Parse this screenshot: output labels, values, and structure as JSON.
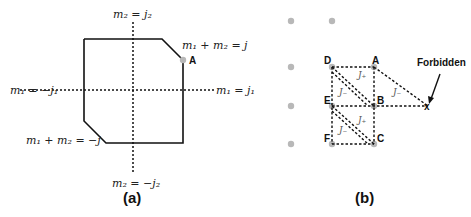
{
  "panel_a": {
    "caption": "(a)",
    "labels": {
      "top": "m₂ = j₂",
      "bottom": "m₂ = −j₂",
      "left": "m₁ = −j₁",
      "right": "m₁ = j₁",
      "upper_diag": "m₁ + m₂ = j",
      "lower_diag": "m₁ + m₂ = −j",
      "point_a": "A"
    }
  },
  "panel_b": {
    "caption": "(b)",
    "points": {
      "a": "A",
      "b": "B",
      "c": "C",
      "d": "D",
      "e": "E",
      "f": "F",
      "x": "x"
    },
    "forbidden_label": "Forbidden",
    "operators": {
      "j_plus": "J₊",
      "j_minus": "J₋"
    },
    "colors": {
      "dot": "#b8b8b8",
      "line": "#111111"
    }
  }
}
